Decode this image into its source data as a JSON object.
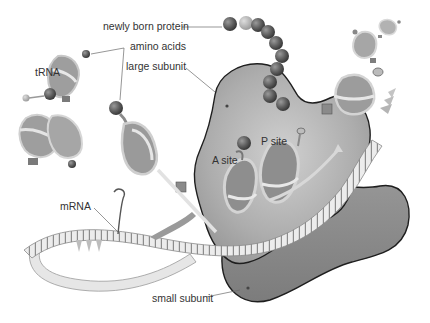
{
  "diagram": {
    "labels": {
      "newly_born_protein": "newly born protein",
      "amino_acids": "amino acids",
      "large_subunit": "large subunit",
      "trna": "tRNA",
      "a_site": "A site",
      "p_site": "P site",
      "mrna": "mRNA",
      "small_subunit": "small subunit"
    },
    "colors": {
      "background": "#ffffff",
      "large_subunit_fill": "#a9a9a9",
      "small_subunit_fill": "#8a8a8a",
      "outline": "#1e1e1e",
      "bead_dark": "#5e5e5e",
      "bead_light": "#b8b8b8",
      "mrna_fill": "#e2e2e2",
      "label_text": "#333333",
      "leader_line": "#6a6a6a"
    }
  }
}
